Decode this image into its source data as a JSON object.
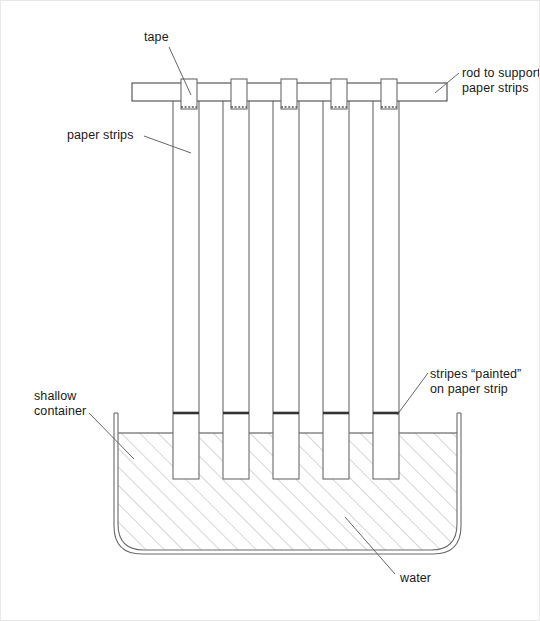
{
  "diagram": {
    "type": "science-apparatus-diagram",
    "colors": {
      "stroke": "#4a4a4a",
      "stroke_dark": "#333333",
      "stripe": "#333333",
      "hatch": "#b5b5b5",
      "text": "#1a1a1a",
      "background": "#ffffff"
    },
    "labels": [
      {
        "name": "tape",
        "text": "tape",
        "lines": [
          "tape"
        ]
      },
      {
        "name": "rod",
        "text": "rod to support paper strips",
        "lines": [
          "rod to support",
          "paper strips"
        ]
      },
      {
        "name": "paper-strips",
        "text": "paper strips",
        "lines": [
          "paper strips"
        ]
      },
      {
        "name": "stripes",
        "text": "stripes “painted” on paper strip",
        "lines": [
          "stripes “painted”",
          "on paper strip"
        ]
      },
      {
        "name": "shallow-container",
        "text": "shallow container",
        "lines": [
          "shallow",
          "container"
        ]
      },
      {
        "name": "water",
        "text": "water",
        "lines": [
          "water"
        ]
      }
    ],
    "label_text": {
      "tape": "tape",
      "rod_line1": "rod to support",
      "rod_line2": "paper strips",
      "paper_strips": "paper strips",
      "stripes_line1": "stripes “painted”",
      "stripes_line2": "on paper strip",
      "shallow_line1": "shallow",
      "shallow_line2": "container",
      "water": "water"
    },
    "geometry": {
      "rod": {
        "x1": 131,
        "y1": 82,
        "x2": 446,
        "y2": 100
      },
      "strip_count": 5,
      "strips_x": [
        172,
        222,
        272,
        322,
        372
      ],
      "strip_width": 26,
      "strip_top": 90,
      "strip_bottom": 478,
      "tape_width": 16,
      "tape_top": 78,
      "tape_bottom": 108,
      "stripe_y": 412,
      "water_surface_y": 432,
      "container": {
        "left": 113,
        "right": 460,
        "top": 412,
        "bottom": 553,
        "corner_radius": 30
      }
    }
  }
}
